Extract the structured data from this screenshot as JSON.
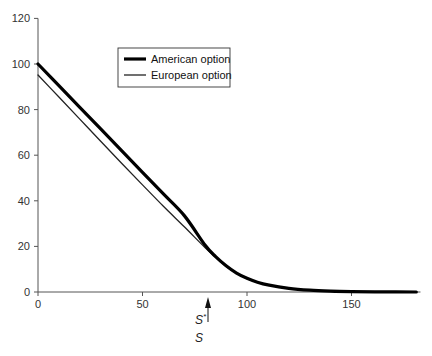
{
  "chart_data": {
    "type": "line",
    "title": "",
    "xlabel": "",
    "ylabel": "",
    "xlim": [
      0,
      183
    ],
    "ylim": [
      0,
      120
    ],
    "grid": false,
    "legend_position": "upper-center (inset box)",
    "x_ticks": [
      0,
      50,
      100,
      150
    ],
    "y_ticks": [
      0,
      20,
      40,
      60,
      80,
      100,
      120
    ],
    "x_tick_labels": [
      "0",
      "50",
      "100",
      "150"
    ],
    "y_tick_labels": [
      "0",
      "20",
      "40",
      "60",
      "80",
      "100",
      "120"
    ],
    "series": [
      {
        "name": "American option",
        "style": "thick",
        "color": "#000000",
        "x": [
          0,
          10,
          20,
          30,
          40,
          50,
          60,
          70,
          80,
          85,
          90,
          95,
          100,
          105,
          110,
          120,
          130,
          140,
          150,
          165,
          181
        ],
        "y": [
          100,
          90.5,
          81,
          71.5,
          62,
          52.5,
          43,
          33.5,
          20.5,
          15.5,
          11.5,
          8.3,
          6,
          4.3,
          3.1,
          1.6,
          0.8,
          0.4,
          0.2,
          0.05,
          0
        ]
      },
      {
        "name": "European option",
        "style": "thin",
        "color": "#222222",
        "x": [
          0,
          10,
          20,
          30,
          40,
          50,
          60,
          70,
          80,
          85,
          90,
          95,
          100,
          105,
          110,
          120,
          130,
          140,
          150,
          165,
          181
        ],
        "y": [
          95.2,
          85.5,
          75.8,
          66.1,
          56.5,
          47,
          37.6,
          28.6,
          19.4,
          15.2,
          11.2,
          8.2,
          5.9,
          4.2,
          3.0,
          1.5,
          0.8,
          0.4,
          0.2,
          0.05,
          0
        ]
      }
    ],
    "annotations": [
      {
        "type": "arrow",
        "x": 81,
        "direction": "up",
        "label": "S*",
        "note": "critical stock price marker below x-axis"
      },
      {
        "type": "text",
        "x": 81,
        "label": "S",
        "note": "x-axis variable label (stock price)"
      }
    ]
  },
  "legend": {
    "items": [
      {
        "label": "American option",
        "stroke_width": 3.2
      },
      {
        "label": "European option",
        "stroke_width": 1.3
      }
    ]
  },
  "annotation_labels": {
    "critical_price": "S",
    "critical_price_sup": "*",
    "axis_variable": "S"
  }
}
